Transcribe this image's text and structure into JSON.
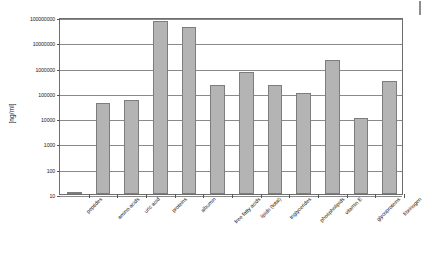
{
  "chart_data": {
    "type": "bar",
    "title": "",
    "xlabel": "",
    "ylabel": "[ng/ml]",
    "yscale": "log",
    "ylim": [
      10,
      100000000
    ],
    "grid": true,
    "legend": false,
    "ytick_labels": [
      "100000000",
      "10000000",
      "1000000",
      "100000",
      "10000",
      "1000",
      "100",
      "10"
    ],
    "ytick_values": [
      100000000,
      10000000,
      1000000,
      100000,
      10000,
      1000,
      100,
      10
    ],
    "categories": [
      "peptides",
      "amino acids",
      "uric acid",
      "proteins",
      "albumin",
      "free fatty acids",
      "lipids (total)",
      "triglycerides",
      "phospholipids",
      "vitamin E",
      "glycoproteins",
      "fibrinogen"
    ],
    "values": [
      10,
      40000,
      50000,
      70000000,
      40000000,
      200000,
      700000,
      200000,
      100000,
      2000000,
      10000,
      300000
    ],
    "series": [
      {
        "name": "concentration",
        "values": [
          10,
          40000,
          50000,
          70000000,
          40000000,
          200000,
          700000,
          200000,
          100000,
          2000000,
          10000,
          300000
        ]
      }
    ],
    "bar_color": "#b4b4b4",
    "bar_edge_color": "#7d7d7d"
  },
  "axis": {
    "y_title": "[ng/ml]"
  }
}
